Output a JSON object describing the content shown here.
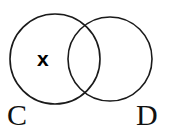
{
  "figure": {
    "type": "venn-diagram",
    "background_color": "#ffffff",
    "stroke_color": "#1a1a1a",
    "text_color": "#111111"
  },
  "sets": [
    {
      "id": "C",
      "label": "C",
      "label_position": "bottom-left",
      "center_x": 55,
      "center_y": 59,
      "radius": 45
    },
    {
      "id": "D",
      "label": "D",
      "label_position": "bottom-right",
      "center_x": 110,
      "center_y": 59,
      "radius": 42
    }
  ],
  "elements": [
    {
      "id": "x",
      "label": "x",
      "region": "C-only",
      "x": 46,
      "y": 59
    }
  ]
}
